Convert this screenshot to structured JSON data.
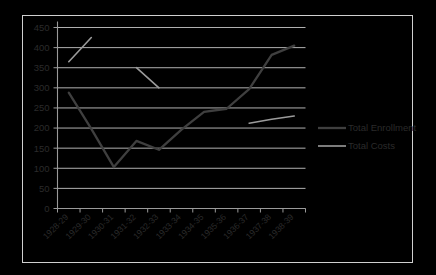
{
  "chart_data": {
    "type": "line",
    "title": "",
    "xlabel": "",
    "ylabel": "",
    "categories": [
      "1928-29",
      "1929-30",
      "1930-31",
      "1931-32",
      "1932-33",
      "1933-34",
      "1934-35",
      "1935-36",
      "1936-37",
      "1937-38",
      "1938-39"
    ],
    "ylim": [
      0,
      450
    ],
    "ytick_labels": [
      "0",
      "50",
      "100",
      "150",
      "200",
      "250",
      "300",
      "350",
      "400",
      "450"
    ],
    "yticks": [
      0,
      50,
      100,
      150,
      200,
      250,
      300,
      350,
      400,
      450
    ],
    "grid": true,
    "legend_position": "right",
    "series": [
      {
        "name": "Total Enrollment",
        "color": "#3f3f3f",
        "width": 2.3,
        "values": [
          288,
          198,
          103,
          168,
          146,
          196,
          240,
          248,
          297,
          382,
          405
        ]
      },
      {
        "name": "Total Costs",
        "color": "#9b9b9b",
        "width": 1.6,
        "values": [
          365,
          425,
          null,
          350,
          300,
          null,
          null,
          null,
          212,
          222,
          230
        ]
      }
    ]
  },
  "legend": {
    "entries": [
      {
        "label": "Total Enrollment"
      },
      {
        "label": "Total Costs"
      }
    ]
  },
  "colors": {
    "enrollment": "#3f3f3f",
    "costs": "#9b9b9b",
    "grid": "#c4c4c4",
    "axis": "#9a9a9a",
    "border": "#d0d0d0",
    "text": "#2b2b2b",
    "background": "#ffffff"
  }
}
